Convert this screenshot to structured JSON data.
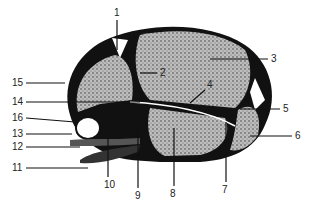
{
  "diagram": {
    "labels": [
      {
        "id": "1",
        "text": "1",
        "x": 114,
        "y": 8
      },
      {
        "id": "2",
        "text": "2",
        "x": 160,
        "y": 70
      },
      {
        "id": "3",
        "text": "3",
        "x": 272,
        "y": 56
      },
      {
        "id": "4",
        "text": "4",
        "x": 207,
        "y": 80
      },
      {
        "id": "5",
        "text": "5",
        "x": 283,
        "y": 104
      },
      {
        "id": "6",
        "text": "6",
        "x": 296,
        "y": 131
      },
      {
        "id": "7",
        "text": "7",
        "x": 222,
        "y": 186
      },
      {
        "id": "8",
        "text": "8",
        "x": 171,
        "y": 190
      },
      {
        "id": "9",
        "text": "9",
        "x": 135,
        "y": 192
      },
      {
        "id": "10",
        "text": "10",
        "x": 104,
        "y": 180
      },
      {
        "id": "11",
        "text": "11",
        "x": 13,
        "y": 165
      },
      {
        "id": "12",
        "text": "12",
        "x": 12,
        "y": 144
      },
      {
        "id": "13",
        "text": "13",
        "x": 12,
        "y": 130
      },
      {
        "id": "14",
        "text": "14",
        "x": 13,
        "y": 99
      },
      {
        "id": "15",
        "text": "15",
        "x": 13,
        "y": 80
      },
      {
        "id": "16",
        "text": "16",
        "x": 12,
        "y": 115
      }
    ]
  }
}
